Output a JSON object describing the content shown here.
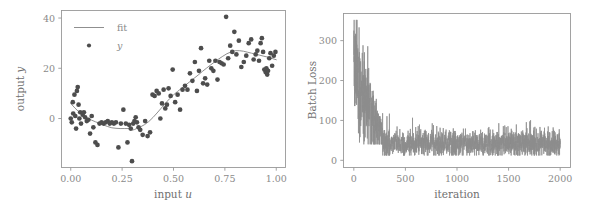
{
  "figure": {
    "background_color": "#ffffff",
    "point_color": "#4d4d4d",
    "line_color": "#8f8f8f",
    "axis_color": "#999999",
    "text_color": "#8a8a8a"
  },
  "chart_data": [
    {
      "type": "scatter",
      "panel": "left",
      "title": "",
      "xlabel": "input u",
      "ylabel": "output y",
      "xlim": [
        -0.045,
        1.045
      ],
      "ylim": [
        -19.5,
        43.0
      ],
      "grid": false,
      "legend_position": "upper left",
      "xticks": [
        0.0,
        0.25,
        0.5,
        0.75,
        1.0
      ],
      "xticklabels": [
        "0.00",
        "0.25",
        "0.50",
        "0.75",
        "1.00"
      ],
      "yticks": [
        0,
        20,
        40
      ],
      "yticklabels": [
        "0",
        "20",
        "40"
      ],
      "series": [
        {
          "name": "y",
          "type": "scatter",
          "legend": "y",
          "marker": "circle",
          "color": "#4d4d4d",
          "x": [
            0.0,
            0.005,
            0.01,
            0.012,
            0.018,
            0.022,
            0.026,
            0.03,
            0.034,
            0.038,
            0.042,
            0.046,
            0.05,
            0.058,
            0.064,
            0.07,
            0.078,
            0.086,
            0.094,
            0.102,
            0.11,
            0.12,
            0.13,
            0.14,
            0.15,
            0.16,
            0.17,
            0.18,
            0.19,
            0.2,
            0.21,
            0.22,
            0.232,
            0.244,
            0.256,
            0.268,
            0.276,
            0.284,
            0.292,
            0.298,
            0.304,
            0.31,
            0.316,
            0.322,
            0.33,
            0.338,
            0.35,
            0.362,
            0.374,
            0.386,
            0.398,
            0.408,
            0.418,
            0.428,
            0.436,
            0.444,
            0.452,
            0.46,
            0.468,
            0.476,
            0.486,
            0.496,
            0.508,
            0.52,
            0.532,
            0.544,
            0.556,
            0.568,
            0.58,
            0.592,
            0.604,
            0.614,
            0.624,
            0.634,
            0.644,
            0.654,
            0.664,
            0.674,
            0.684,
            0.694,
            0.704,
            0.714,
            0.724,
            0.734,
            0.744,
            0.756,
            0.766,
            0.776,
            0.786,
            0.796,
            0.806,
            0.818,
            0.83,
            0.842,
            0.854,
            0.866,
            0.878,
            0.89,
            0.9,
            0.908,
            0.916,
            0.924,
            0.93,
            0.936,
            0.942,
            0.948,
            0.952,
            0.956,
            0.96,
            0.966,
            0.972,
            0.98,
            0.988,
            0.996
          ],
          "y": [
            0.0,
            -1.5,
            6.5,
            2.0,
            9.5,
            1.0,
            -4.0,
            11.0,
            12.5,
            5.5,
            0.0,
            2.5,
            -2.0,
            1.5,
            2.5,
            0.5,
            -1.0,
            -0.5,
            -6.0,
            1.0,
            -3.5,
            -9.5,
            -10.5,
            -2.0,
            -1.5,
            -2.0,
            -1.5,
            -1.0,
            -2.0,
            -1.5,
            -2.0,
            -1.5,
            -11.5,
            -2.0,
            3.5,
            -2.0,
            -9.5,
            -2.5,
            -4.0,
            -17.0,
            -2.0,
            -1.0,
            0.5,
            -1.5,
            -3.5,
            -4.5,
            -6.5,
            -1.0,
            -7.0,
            -5.5,
            9.5,
            9.0,
            11.0,
            10.0,
            0.0,
            6.0,
            11.5,
            4.0,
            5.5,
            12.0,
            9.0,
            19.5,
            6.5,
            9.5,
            3.5,
            11.5,
            13.0,
            11.5,
            18.0,
            15.0,
            22.5,
            11.0,
            19.0,
            28.0,
            14.0,
            16.0,
            13.5,
            23.0,
            20.0,
            19.0,
            23.0,
            15.5,
            22.5,
            22.0,
            21.5,
            40.5,
            24.0,
            29.0,
            26.5,
            34.5,
            25.5,
            31.0,
            20.5,
            22.5,
            25.0,
            30.0,
            31.5,
            23.5,
            25.5,
            27.0,
            23.0,
            30.0,
            32.0,
            26.5,
            19.5,
            18.5,
            20.0,
            17.5,
            19.0,
            24.0,
            26.0,
            21.0,
            25.0,
            26.5
          ]
        },
        {
          "name": "fit",
          "type": "line",
          "legend": "fit",
          "color": "#8f8f8f",
          "x": [
            0.0,
            0.02,
            0.04,
            0.06,
            0.08,
            0.1,
            0.12,
            0.14,
            0.16,
            0.18,
            0.2,
            0.22,
            0.24,
            0.26,
            0.28,
            0.29,
            0.3,
            0.31,
            0.32,
            0.34,
            0.36,
            0.38,
            0.4,
            0.42,
            0.44,
            0.46,
            0.48,
            0.5,
            0.52,
            0.54,
            0.56,
            0.58,
            0.6,
            0.62,
            0.64,
            0.66,
            0.68,
            0.7,
            0.72,
            0.74,
            0.76,
            0.78,
            0.8,
            0.82,
            0.84,
            0.86,
            0.88,
            0.9,
            0.92,
            0.94,
            0.96,
            0.98,
            1.0
          ],
          "y": [
            6.0,
            4.2,
            2.6,
            1.3,
            0.2,
            -0.6,
            -1.3,
            -1.9,
            -2.6,
            -3.2,
            -3.7,
            -3.9,
            -4.0,
            -4.0,
            -4.0,
            -4.4,
            -4.6,
            -4.4,
            -4.0,
            -3.3,
            -2.4,
            -1.2,
            0.4,
            2.2,
            4.1,
            6.0,
            7.8,
            9.4,
            10.8,
            12.1,
            13.4,
            14.7,
            16.0,
            17.3,
            18.7,
            20.0,
            21.3,
            22.5,
            23.7,
            24.8,
            25.8,
            26.5,
            27.0,
            27.0,
            26.8,
            26.4,
            26.0,
            25.6,
            25.2,
            24.8,
            24.4,
            23.9,
            23.4
          ]
        }
      ]
    },
    {
      "type": "line",
      "panel": "right",
      "title": "",
      "xlabel": "iteration",
      "ylabel": "Batch Loss",
      "xlim": [
        -100,
        2100
      ],
      "ylim": [
        -18,
        368
      ],
      "grid": false,
      "xticks": [
        0,
        500,
        1000,
        1500,
        2000
      ],
      "xticklabels": [
        "0",
        "500",
        "1000",
        "1500",
        "2000"
      ],
      "yticks": [
        0,
        100,
        200,
        300
      ],
      "yticklabels": [
        "0",
        "100",
        "200",
        "300"
      ],
      "series": [
        {
          "name": "Batch Loss",
          "color": "#8c8c8c",
          "notes": "high-variance loss trace: starts ~200-350, decays to plateau ~20-70 after iteration ~280",
          "envelope": {
            "phase1_end_iter": 280,
            "phase1_start_mean": 250,
            "phase1_end_mean": 60,
            "phase1_start_spread": 150,
            "phase1_end_spread": 40,
            "plateau_mean": 42,
            "plateau_low": 15,
            "plateau_high": 85,
            "plateau_spikes_high": 120
          }
        }
      ]
    }
  ],
  "panels": {
    "left": {
      "legend": [
        {
          "label": "fit",
          "marker": "line"
        },
        {
          "label": "y",
          "marker": "dot"
        }
      ],
      "ylabel_static": "output ",
      "ylabel_italic": "y",
      "xlabel_static": "input ",
      "xlabel_italic": "u"
    },
    "right": {
      "ylabel": "Batch Loss",
      "xlabel": "iteration"
    }
  }
}
